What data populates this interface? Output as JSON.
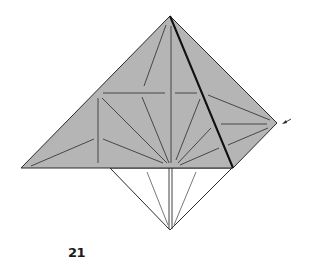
{
  "diagram": {
    "type": "origami-step",
    "step_number": "21",
    "colors": {
      "paper_colored": "#b5b5b5",
      "paper_white": "#ffffff",
      "line": "#2a2a2a",
      "fold_line": "#3a3a3a"
    },
    "shapes": {
      "upper_triangle": {
        "points": [
          [
            170,
            16
          ],
          [
            21,
            168
          ],
          [
            233,
            168
          ]
        ]
      },
      "right_flap": {
        "points": [
          [
            170,
            16
          ],
          [
            277,
            123
          ],
          [
            233,
            168
          ]
        ]
      },
      "lower_triangle": {
        "points": [
          [
            110,
            168
          ],
          [
            232,
            168
          ],
          [
            170,
            230
          ]
        ]
      }
    },
    "arrow": {
      "from": [
        290,
        119
      ],
      "to": [
        283,
        124
      ],
      "label": "push-in arrow"
    }
  }
}
